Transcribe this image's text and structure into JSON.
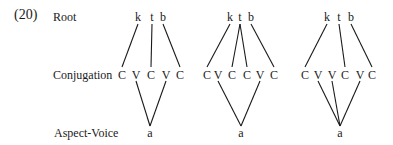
{
  "example_number": "(20)",
  "tier_labels": {
    "root": "Root",
    "conjugation": "Conjugation",
    "aspect_voice": "Aspect-Voice"
  },
  "trees": [
    {
      "root": [
        "k",
        "t",
        "b"
      ],
      "root_x": [
        138,
        152,
        163
      ],
      "skeleton": [
        "C",
        "V",
        "C",
        "V",
        "C"
      ],
      "skeleton_x": [
        122,
        136,
        151,
        166,
        180
      ],
      "melody": "a",
      "melody_x": 150,
      "root_links": [
        [
          0,
          0
        ],
        [
          1,
          2
        ],
        [
          2,
          4
        ]
      ],
      "melody_links": [
        1,
        3
      ]
    },
    {
      "root": [
        "k",
        "t",
        "b"
      ],
      "root_x": [
        230,
        240,
        251
      ],
      "skeleton": [
        "C",
        "V",
        "C",
        "C",
        "V",
        "C"
      ],
      "skeleton_x": [
        207,
        218,
        232,
        247,
        260,
        274
      ],
      "melody": "a",
      "melody_x": 241,
      "root_links": [
        [
          0,
          0
        ],
        [
          1,
          2
        ],
        [
          1,
          3
        ],
        [
          2,
          5
        ]
      ],
      "melody_links": [
        1,
        4
      ]
    },
    {
      "root": [
        "k",
        "t",
        "b"
      ],
      "root_x": [
        327,
        339,
        351
      ],
      "skeleton": [
        "C",
        "V",
        "V",
        "C",
        "V",
        "C"
      ],
      "skeleton_x": [
        305,
        318,
        332,
        345,
        360,
        372
      ],
      "melody": "a",
      "melody_x": 340,
      "root_links": [
        [
          0,
          0
        ],
        [
          1,
          3
        ],
        [
          2,
          5
        ]
      ],
      "melody_links": [
        1,
        2,
        4
      ]
    }
  ],
  "colors": {
    "ink": "#1a1a1a",
    "background": "#ffffff"
  }
}
